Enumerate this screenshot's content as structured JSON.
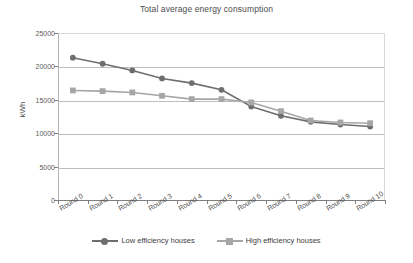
{
  "chart_data": {
    "type": "line",
    "title": "Total average energy consumption",
    "xlabel": "",
    "ylabel": "kWh",
    "categories": [
      "Round 0",
      "Round 1",
      "Round 2",
      "Round 3",
      "Round 4",
      "Round 5",
      "Round 6",
      "Round 7",
      "Round 8",
      "Round 9",
      "Round 10"
    ],
    "series": [
      {
        "name": "Low efficiency houses",
        "color": "#6e6e6e",
        "marker": "circle",
        "values": [
          21300,
          20400,
          19400,
          18200,
          17500,
          16500,
          14000,
          12600,
          11700,
          11300,
          11000
        ]
      },
      {
        "name": "High efficiency houses",
        "color": "#a6a6a6",
        "marker": "square",
        "values": [
          16400,
          16300,
          16100,
          15600,
          15100,
          15100,
          14600,
          13300,
          11900,
          11600,
          11500
        ]
      }
    ],
    "ylim": [
      0,
      25000
    ],
    "yticks": [
      0,
      5000,
      10000,
      15000,
      20000,
      25000
    ],
    "ytick_labels": [
      "0",
      "5000",
      "10000",
      "15000",
      "20000",
      "25000"
    ],
    "grid": true,
    "legend_position": "bottom"
  }
}
